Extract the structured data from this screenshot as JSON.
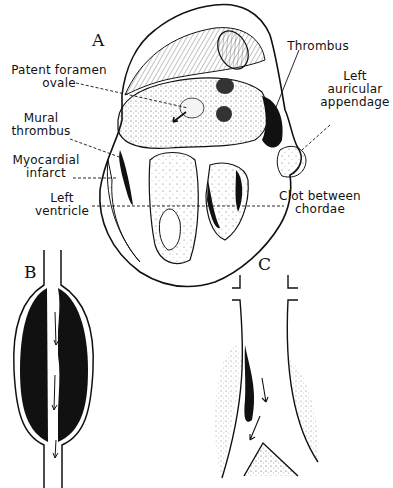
{
  "figure": {
    "panels": [
      {
        "id": "A",
        "letter": "A",
        "subject": "heart-cross-section"
      },
      {
        "id": "B",
        "letter": "B",
        "subject": "vessel-with-occluding-thrombus"
      },
      {
        "id": "C",
        "letter": "C",
        "subject": "vessel-bifurcation-with-mural-thrombus"
      }
    ],
    "labels": {
      "patent_foramen_ovale_line1": "Patent foramen",
      "patent_foramen_ovale_line2": "ovale",
      "mural_thrombus_line1": "Mural",
      "mural_thrombus_line2": "thrombus",
      "myocardial_infarct_line1": "Myocardial",
      "myocardial_infarct_line2": "infarct",
      "left_ventricle_line1": "Left",
      "left_ventricle_line2": "ventricle",
      "thrombus": "Thrombus",
      "left_auricular_appendage_line1": "Left",
      "left_auricular_appendage_line2": "auricular",
      "left_auricular_appendage_line3": "appendage",
      "clot_between_chordae_line1": "Clot between",
      "clot_between_chordae_line2": "chordae"
    },
    "colors": {
      "ink": "#111111",
      "paper": "#ffffff",
      "stipple": "#555555"
    }
  }
}
